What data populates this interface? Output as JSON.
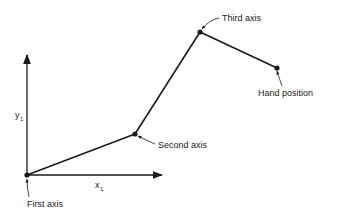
{
  "diagram": {
    "type": "robot-arm-kinematics",
    "axes": {
      "x_label": "x",
      "x_subscript": "1",
      "y_label": "y",
      "y_subscript": "1"
    },
    "joints": [
      {
        "id": "first",
        "label": "First axis",
        "x": 27,
        "y": 175
      },
      {
        "id": "second",
        "label": "Second axis",
        "x": 135,
        "y": 134
      },
      {
        "id": "third",
        "label": "Third axis",
        "x": 200,
        "y": 32
      },
      {
        "id": "hand",
        "label": "Hand position",
        "x": 277,
        "y": 68
      }
    ],
    "colors": {
      "line": "#1a1a1a",
      "background": "#ffffff"
    }
  }
}
